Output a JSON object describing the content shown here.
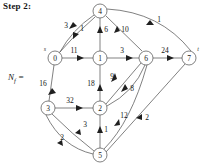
{
  "header": {
    "step_title": "Step 2:"
  },
  "graph": {
    "matrix_label": "N",
    "matrix_label_sub": "f",
    "matrix_label_eq": " =",
    "source_label": "s",
    "sink_label": "t",
    "nodes": [
      {
        "id": "0",
        "label": "0",
        "x": 55,
        "y": 58
      },
      {
        "id": "1",
        "label": "1",
        "x": 100,
        "y": 58
      },
      {
        "id": "2",
        "label": "2",
        "x": 100,
        "y": 108
      },
      {
        "id": "3",
        "label": "3",
        "x": 48,
        "y": 108
      },
      {
        "id": "4",
        "label": "4",
        "x": 100,
        "y": 11
      },
      {
        "id": "5",
        "label": "5",
        "x": 100,
        "y": 155
      },
      {
        "id": "6",
        "label": "6",
        "x": 146,
        "y": 58
      },
      {
        "id": "7",
        "label": "7",
        "x": 189,
        "y": 58
      }
    ],
    "edges": [
      {
        "from": "0",
        "to": "4",
        "label": "3",
        "lx": 69,
        "ly": 28
      },
      {
        "from": "4",
        "to": "0",
        "label": "1",
        "lx": 82,
        "ly": 31
      },
      {
        "from": "0",
        "to": "1",
        "label": "11",
        "lx": 74,
        "ly": 54
      },
      {
        "from": "1",
        "to": "4",
        "label": "6",
        "lx": 104,
        "ly": 31
      },
      {
        "from": "4",
        "to": "6",
        "label": "10",
        "lx": 124,
        "ly": 33
      },
      {
        "from": "4",
        "to": "7",
        "label": "1",
        "lx": 157,
        "ly": 21
      },
      {
        "from": "1",
        "to": "6",
        "label": "3",
        "lx": 124,
        "ly": 54
      },
      {
        "from": "6",
        "to": "7",
        "label": "24",
        "lx": 165,
        "ly": 54
      },
      {
        "from": "0",
        "to": "3",
        "label": "16",
        "lx": 42,
        "ly": 84
      },
      {
        "from": "2",
        "to": "1",
        "label": "18",
        "lx": 92,
        "ly": 84
      },
      {
        "from": "6",
        "to": "2",
        "label": "9",
        "lx": 114,
        "ly": 80
      },
      {
        "from": "2",
        "to": "6",
        "label": "8",
        "lx": 131,
        "ly": 90
      },
      {
        "from": "3",
        "to": "2",
        "label": "32",
        "lx": 70,
        "ly": 103
      },
      {
        "from": "5",
        "to": "6",
        "label": "12",
        "lx": 123,
        "ly": 116
      },
      {
        "from": "7",
        "to": "5",
        "label": "2",
        "lx": 147,
        "ly": 117
      },
      {
        "from": "5",
        "to": "3",
        "label": "3",
        "lx": 85,
        "ly": 126
      },
      {
        "from": "5",
        "to": "3",
        "label": "2",
        "lx": 64,
        "ly": 139
      },
      {
        "from": "5",
        "to": "2",
        "label": "1",
        "lx": 104,
        "ly": 131
      }
    ]
  }
}
